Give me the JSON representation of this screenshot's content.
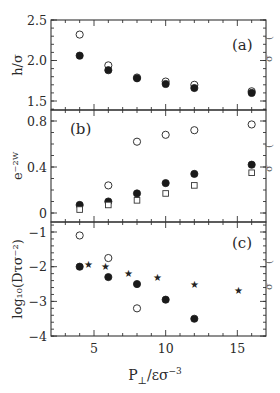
{
  "figure": {
    "xlabel": "P⊥/εσ⁻³",
    "xlabel_parts": {
      "base": "P",
      "sub": "⊥",
      "mid": "/εσ",
      "sup": "−3"
    },
    "x_ticks": [
      5,
      10,
      15
    ],
    "x_tick_labels": [
      "5",
      "10",
      "15"
    ]
  },
  "chart_data": [
    {
      "type": "scatter",
      "panel": "(a)",
      "title": "",
      "xlabel": "P⊥/εσ⁻³",
      "ylabel": "h/σ",
      "xlim": [
        2,
        17
      ],
      "ylim": [
        1.4,
        2.5
      ],
      "y_ticks": [
        1.5,
        2.0,
        2.5
      ],
      "y_tick_labels": [
        "1.5",
        "2.0",
        "2.5"
      ],
      "grid": false,
      "legend": null,
      "series": [
        {
          "name": "open circles",
          "marker": "open-circle",
          "x": [
            4,
            6,
            8,
            10,
            12,
            16
          ],
          "y": [
            2.32,
            1.94,
            1.79,
            1.74,
            1.7,
            1.62
          ]
        },
        {
          "name": "filled circles",
          "marker": "filled-circle",
          "x": [
            4,
            6,
            8,
            10,
            12,
            16
          ],
          "y": [
            2.06,
            1.88,
            1.78,
            1.71,
            1.66,
            1.6
          ]
        }
      ]
    },
    {
      "type": "scatter",
      "panel": "(b)",
      "title": "",
      "xlabel": "P⊥/εσ⁻³",
      "ylabel": "e⁻²ᵂ",
      "xlim": [
        2,
        17
      ],
      "ylim": [
        -0.1,
        0.9
      ],
      "y_ticks": [
        0,
        0.4,
        0.8
      ],
      "y_tick_labels": [
        "0",
        "0.4",
        "0.8"
      ],
      "grid": false,
      "legend": null,
      "series": [
        {
          "name": "open circles",
          "marker": "open-circle",
          "x": [
            6,
            8,
            10,
            12,
            16
          ],
          "y": [
            0.24,
            0.62,
            0.68,
            0.72,
            0.77
          ]
        },
        {
          "name": "filled circles",
          "marker": "filled-circle",
          "x": [
            4,
            6,
            8,
            10,
            12,
            16
          ],
          "y": [
            0.07,
            0.1,
            0.17,
            0.26,
            0.34,
            0.42
          ]
        },
        {
          "name": "open squares",
          "marker": "open-square",
          "x": [
            4,
            6,
            8,
            10,
            12,
            16
          ],
          "y": [
            0.03,
            0.07,
            0.11,
            0.17,
            0.24,
            0.35
          ]
        }
      ]
    },
    {
      "type": "scatter",
      "panel": "(c)",
      "title": "",
      "xlabel": "P⊥/εσ⁻³",
      "ylabel": "log₁₀(Dτσ⁻²)",
      "xlim": [
        2,
        17
      ],
      "ylim": [
        -4,
        -0.8
      ],
      "y_ticks": [
        -1,
        -2,
        -3,
        -4
      ],
      "y_tick_labels": [
        "−1",
        "−2",
        "−3",
        "−4"
      ],
      "grid": false,
      "legend": null,
      "series": [
        {
          "name": "open circles",
          "marker": "open-circle",
          "x": [
            4,
            6,
            8
          ],
          "y": [
            -1.1,
            -1.75,
            -3.2
          ]
        },
        {
          "name": "filled circles",
          "marker": "filled-circle",
          "x": [
            4,
            6,
            8,
            10,
            12
          ],
          "y": [
            -2.0,
            -2.3,
            -2.5,
            -2.95,
            -3.5
          ]
        },
        {
          "name": "stars",
          "marker": "star",
          "x": [
            4.6,
            5.8,
            7.4,
            9.4,
            12.0,
            15.1
          ],
          "y": [
            -1.95,
            -2.0,
            -2.2,
            -2.3,
            -2.5,
            -2.7
          ]
        }
      ]
    }
  ],
  "edge_glyphs": [
    "(",
    "σ",
    "(",
    "σ",
    "(",
    "σ"
  ]
}
